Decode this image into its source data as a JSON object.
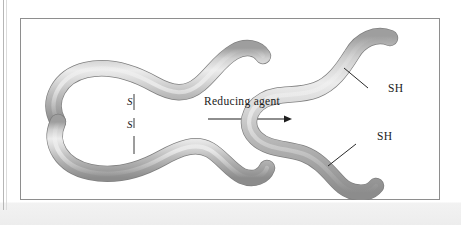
{
  "figure": {
    "type": "biochemistry-diagram",
    "left_structure": {
      "name": "folded-protein-with-disulfide-bond",
      "bond_labels": {
        "sulfur_top": "S",
        "sulfur_bottom": "S"
      }
    },
    "reaction": {
      "arrow_label": "Reducing agent",
      "direction": "left-to-right"
    },
    "right_structure": {
      "name": "reduced-protein-with-free-thiols",
      "thiol_labels": {
        "upper": "SH",
        "lower": "SH"
      }
    },
    "colors": {
      "tube_light": "#e8e8e8",
      "tube_mid": "#b9b9b9",
      "tube_dark": "#8f8f8f",
      "frame": "#8e8e8e",
      "text": "#1a1a1a",
      "background": "#ffffff"
    }
  }
}
